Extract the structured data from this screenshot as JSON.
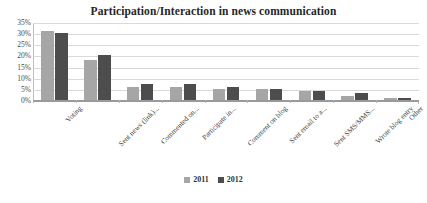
{
  "chart_data": {
    "type": "bar",
    "title": "Participation/Interaction in news communication",
    "xlabel": "",
    "ylabel": "",
    "ylim": [
      0,
      35
    ],
    "ytick_labels": [
      "35%",
      "30%",
      "25%",
      "20%",
      "15%",
      "10%",
      "5%",
      "0%"
    ],
    "ytick_values": [
      35,
      30,
      25,
      20,
      15,
      10,
      5,
      0
    ],
    "grid": true,
    "legend_position": "bottom",
    "categories": [
      "Voting",
      "Sent news (link)...",
      "Commented on...",
      "Participate in...",
      "Comment on blog",
      "Sent email to a...",
      "Sent SMS/MMS...",
      "Wrote blog entry",
      "Other"
    ],
    "series": [
      {
        "name": "2011",
        "color": "#a6a6a6",
        "values": [
          31,
          18,
          6,
          6,
          5,
          5,
          4,
          2,
          1
        ]
      },
      {
        "name": "2012",
        "color": "#4d4d4d",
        "values": [
          30,
          20,
          7,
          7,
          6,
          5,
          4,
          3,
          1
        ]
      }
    ]
  },
  "legend": {
    "items": [
      {
        "label": "2011"
      },
      {
        "label": "2012"
      }
    ]
  },
  "colors": {
    "series_2011": "#a6a6a6",
    "series_2012": "#4d4d4d",
    "gridline": "#d9d9d9",
    "axis": "#9a9a9a",
    "title_text": "#262626"
  }
}
